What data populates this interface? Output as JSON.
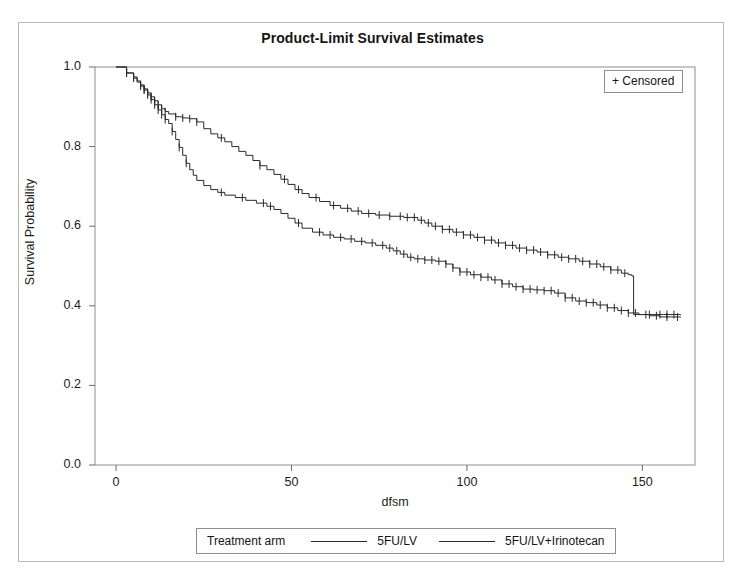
{
  "chart_data": {
    "type": "line",
    "title": "Product-Limit Survival Estimates",
    "xlabel": "dfsm",
    "ylabel": "Survival Probability",
    "xlim": [
      -6,
      165
    ],
    "ylim": [
      0.0,
      1.0
    ],
    "xticks": [
      0,
      50,
      100,
      150
    ],
    "yticks": [
      0.0,
      0.2,
      0.4,
      0.6,
      0.8,
      1.0
    ],
    "ytick_labels": [
      "0.0",
      "0.2",
      "0.4",
      "0.6",
      "0.8",
      "1.0"
    ],
    "xtick_labels": [
      "0",
      "50",
      "100",
      "150"
    ],
    "grid": false,
    "legend_position": "bottom",
    "censored_marker": "+",
    "series": [
      {
        "name": "5FU/LV",
        "color": "#2a2a2a",
        "points": [
          [
            0,
            1.0
          ],
          [
            2,
            1.0
          ],
          [
            3,
            0.985
          ],
          [
            5,
            0.975
          ],
          [
            6,
            0.965
          ],
          [
            7,
            0.955
          ],
          [
            8,
            0.945
          ],
          [
            9,
            0.935
          ],
          [
            10,
            0.925
          ],
          [
            11,
            0.915
          ],
          [
            12,
            0.905
          ],
          [
            13,
            0.895
          ],
          [
            14,
            0.888
          ],
          [
            15,
            0.882
          ],
          [
            17,
            0.875
          ],
          [
            19,
            0.872
          ],
          [
            21,
            0.87
          ],
          [
            23,
            0.862
          ],
          [
            25,
            0.845
          ],
          [
            27,
            0.832
          ],
          [
            29,
            0.822
          ],
          [
            31,
            0.812
          ],
          [
            33,
            0.8
          ],
          [
            35,
            0.788
          ],
          [
            37,
            0.778
          ],
          [
            39,
            0.765
          ],
          [
            41,
            0.752
          ],
          [
            43,
            0.742
          ],
          [
            45,
            0.73
          ],
          [
            47,
            0.718
          ],
          [
            49,
            0.705
          ],
          [
            51,
            0.692
          ],
          [
            53,
            0.682
          ],
          [
            55,
            0.672
          ],
          [
            58,
            0.662
          ],
          [
            61,
            0.652
          ],
          [
            64,
            0.645
          ],
          [
            67,
            0.638
          ],
          [
            70,
            0.632
          ],
          [
            74,
            0.628
          ],
          [
            78,
            0.625
          ],
          [
            82,
            0.622
          ],
          [
            86,
            0.615
          ],
          [
            88,
            0.608
          ],
          [
            90,
            0.6
          ],
          [
            93,
            0.592
          ],
          [
            96,
            0.585
          ],
          [
            99,
            0.578
          ],
          [
            102,
            0.572
          ],
          [
            105,
            0.565
          ],
          [
            108,
            0.558
          ],
          [
            111,
            0.552
          ],
          [
            114,
            0.545
          ],
          [
            117,
            0.54
          ],
          [
            120,
            0.535
          ],
          [
            123,
            0.528
          ],
          [
            126,
            0.522
          ],
          [
            129,
            0.518
          ],
          [
            132,
            0.512
          ],
          [
            135,
            0.505
          ],
          [
            138,
            0.498
          ],
          [
            141,
            0.49
          ],
          [
            144,
            0.482
          ],
          [
            146,
            0.478
          ],
          [
            147,
            0.475
          ],
          [
            147.5,
            0.378
          ],
          [
            150,
            0.378
          ],
          [
            153,
            0.378
          ],
          [
            156,
            0.378
          ],
          [
            159,
            0.378
          ],
          [
            161,
            0.378
          ]
        ],
        "censored_x": [
          3,
          5,
          7,
          8,
          9,
          10,
          11,
          12,
          13,
          14,
          17,
          19,
          21,
          23,
          30,
          41,
          48,
          52,
          57,
          62,
          66,
          69,
          72,
          75,
          78,
          81,
          83,
          85,
          87,
          89,
          91,
          93,
          95,
          97,
          99,
          101,
          103,
          105,
          107,
          109,
          111,
          113,
          115,
          117,
          119,
          121,
          123,
          125,
          127,
          129,
          131,
          133,
          135,
          137,
          139,
          141,
          143,
          145,
          152,
          155,
          157,
          159
        ]
      },
      {
        "name": "5FU/LV+Irinotecan",
        "color": "#2a2a2a",
        "points": [
          [
            0,
            1.0
          ],
          [
            2,
            1.0
          ],
          [
            3,
            0.985
          ],
          [
            5,
            0.972
          ],
          [
            6,
            0.962
          ],
          [
            7,
            0.952
          ],
          [
            8,
            0.942
          ],
          [
            9,
            0.93
          ],
          [
            10,
            0.918
          ],
          [
            11,
            0.905
          ],
          [
            12,
            0.892
          ],
          [
            13,
            0.88
          ],
          [
            14,
            0.868
          ],
          [
            15,
            0.858
          ],
          [
            16,
            0.838
          ],
          [
            17,
            0.818
          ],
          [
            18,
            0.798
          ],
          [
            19,
            0.778
          ],
          [
            20,
            0.758
          ],
          [
            21,
            0.742
          ],
          [
            22,
            0.728
          ],
          [
            23,
            0.715
          ],
          [
            25,
            0.702
          ],
          [
            27,
            0.692
          ],
          [
            29,
            0.685
          ],
          [
            31,
            0.678
          ],
          [
            34,
            0.672
          ],
          [
            37,
            0.665
          ],
          [
            40,
            0.658
          ],
          [
            43,
            0.65
          ],
          [
            45,
            0.642
          ],
          [
            47,
            0.632
          ],
          [
            49,
            0.62
          ],
          [
            51,
            0.608
          ],
          [
            53,
            0.595
          ],
          [
            56,
            0.585
          ],
          [
            59,
            0.578
          ],
          [
            62,
            0.572
          ],
          [
            65,
            0.568
          ],
          [
            68,
            0.562
          ],
          [
            71,
            0.558
          ],
          [
            74,
            0.552
          ],
          [
            77,
            0.545
          ],
          [
            79,
            0.538
          ],
          [
            81,
            0.53
          ],
          [
            83,
            0.522
          ],
          [
            85,
            0.518
          ],
          [
            88,
            0.515
          ],
          [
            91,
            0.512
          ],
          [
            94,
            0.505
          ],
          [
            96,
            0.495
          ],
          [
            98,
            0.485
          ],
          [
            101,
            0.478
          ],
          [
            104,
            0.472
          ],
          [
            107,
            0.465
          ],
          [
            110,
            0.455
          ],
          [
            113,
            0.448
          ],
          [
            116,
            0.442
          ],
          [
            119,
            0.44
          ],
          [
            122,
            0.438
          ],
          [
            125,
            0.432
          ],
          [
            128,
            0.42
          ],
          [
            131,
            0.412
          ],
          [
            134,
            0.408
          ],
          [
            137,
            0.402
          ],
          [
            140,
            0.395
          ],
          [
            143,
            0.388
          ],
          [
            146,
            0.382
          ],
          [
            149,
            0.378
          ],
          [
            152,
            0.375
          ],
          [
            155,
            0.372
          ],
          [
            158,
            0.372
          ],
          [
            161,
            0.372
          ]
        ],
        "censored_x": [
          3,
          5,
          7,
          8,
          9,
          10,
          11,
          12,
          13,
          14,
          16,
          18,
          20,
          30,
          36,
          42,
          44,
          52,
          58,
          61,
          64,
          67,
          70,
          73,
          76,
          78,
          80,
          82,
          84,
          86,
          88,
          90,
          92,
          94,
          96,
          98,
          100,
          102,
          104,
          106,
          108,
          110,
          112,
          114,
          116,
          118,
          120,
          122,
          124,
          126,
          128,
          130,
          132,
          134,
          136,
          138,
          140,
          142,
          144,
          146,
          148,
          151,
          154,
          157,
          160
        ]
      }
    ]
  },
  "censored_legend": {
    "label": "+ Censored"
  },
  "arm_legend": {
    "title": "Treatment arm",
    "entries": [
      {
        "label": "5FU/LV"
      },
      {
        "label": "5FU/LV+Irinotecan"
      }
    ]
  }
}
